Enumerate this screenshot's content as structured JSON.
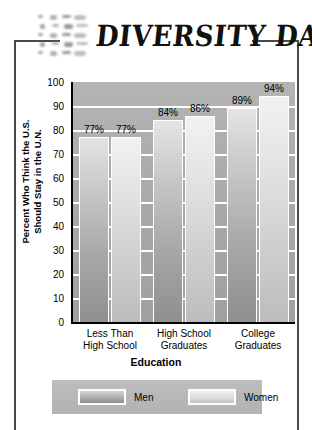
{
  "header": {
    "title": "DIVERSITY DATA",
    "logo_icon": "mosaic-tiles-icon"
  },
  "chart_data": {
    "type": "bar",
    "title": "DIVERSITY DATA",
    "xlabel": "Education",
    "ylabel": "Percent Who Think the U.S. Should Stay in the U.N.",
    "ylabel_line1": "Percent Who Think the U.S.",
    "ylabel_line2": "Should Stay in the U.N.",
    "ylim": [
      0,
      100
    ],
    "ytick_step": 10,
    "yticks": [
      "100",
      "90",
      "80",
      "70",
      "60",
      "50",
      "40",
      "30",
      "20",
      "10",
      "0"
    ],
    "grid": true,
    "legend_position": "bottom",
    "categories": [
      "Less Than High School",
      "High School Graduates",
      "College Graduates"
    ],
    "category_lines": [
      [
        "Less Than",
        "High School"
      ],
      [
        "High School",
        "Graduates"
      ],
      [
        "College",
        "Graduates"
      ]
    ],
    "series": [
      {
        "name": "Men",
        "values": [
          77,
          84,
          89
        ],
        "labels": [
          "77%",
          "84%",
          "89%"
        ],
        "color": "#a9a9a9"
      },
      {
        "name": "Women",
        "values": [
          77,
          86,
          94
        ],
        "labels": [
          "77%",
          "86%",
          "94%"
        ],
        "color": "#cfcfcf"
      }
    ],
    "plot_background": "#a8a8a8",
    "gridline_color": "#ffffff"
  },
  "legend": {
    "items": [
      {
        "label": "Men",
        "swatch": "men-swatch"
      },
      {
        "label": "Women",
        "swatch": "women-swatch"
      }
    ]
  }
}
